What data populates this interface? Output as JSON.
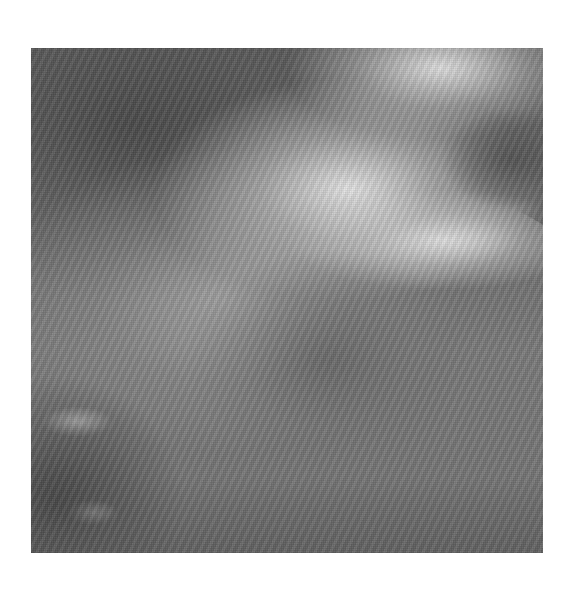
{
  "image": {
    "subject": "grayscale radiograph of heel bone (calcaneus) showing trabecular pattern",
    "background_color": "#ffffff",
    "tones": {
      "dark": "#5e5e5e",
      "mid": "#7a7a7a",
      "bright": "#ebebeb"
    }
  }
}
